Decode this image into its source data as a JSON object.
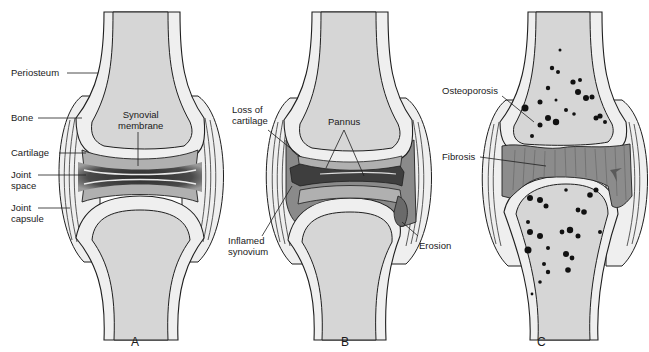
{
  "figure": {
    "panels": [
      {
        "id": "A",
        "letter": "A",
        "state": "normal joint",
        "labels": {
          "periosteum": "Periosteum",
          "bone": "Bone",
          "synovial_membrane_1": "Synovial",
          "synovial_membrane_2": "membrane",
          "cartilage": "Cartilage",
          "joint_space_1": "Joint",
          "joint_space_2": "space",
          "joint_capsule_1": "Joint",
          "joint_capsule_2": "capsule"
        }
      },
      {
        "id": "B",
        "letter": "B",
        "state": "inflamed joint",
        "labels": {
          "loss_of_cartilage_1": "Loss of",
          "loss_of_cartilage_2": "cartilage",
          "pannus": "Pannus",
          "inflamed_synovium_1": "Inflamed",
          "inflamed_synovium_2": "synovium",
          "erosion": "Erosion"
        }
      },
      {
        "id": "C",
        "letter": "C",
        "state": "fibrosed joint",
        "labels": {
          "osteoporosis": "Osteoporosis",
          "fibrosis": "Fibrosis"
        }
      }
    ],
    "colors": {
      "bone_fill": "#d6d6d6",
      "cortex_fill": "#efefef",
      "outline": "#1f1f1f",
      "cartilage": "#b0b0b0",
      "joint_space_dark": "#3a3a3a",
      "synovium": "#8a8a8a",
      "fibrosis": "#8c8c8c",
      "capsule": "#e8e8e8",
      "pores": "#111111"
    }
  }
}
